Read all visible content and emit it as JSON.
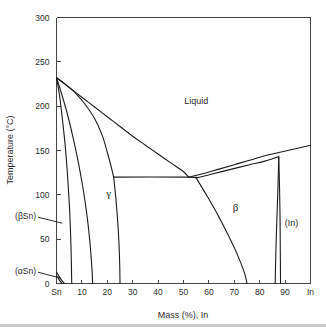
{
  "chart_data": {
    "type": "line",
    "title": "",
    "xlabel": "Mass (%), In",
    "ylabel": "Temperature (°C)",
    "xlim": [
      0,
      100
    ],
    "ylim": [
      0,
      300
    ],
    "grid": false,
    "legend": null,
    "x_ticks": [
      {
        "value": 0,
        "label": "Sn"
      },
      {
        "value": 10,
        "label": "10"
      },
      {
        "value": 20,
        "label": "20"
      },
      {
        "value": 30,
        "label": "30"
      },
      {
        "value": 40,
        "label": "40"
      },
      {
        "value": 50,
        "label": "50"
      },
      {
        "value": 60,
        "label": "60"
      },
      {
        "value": 70,
        "label": "70"
      },
      {
        "value": 80,
        "label": "80"
      },
      {
        "value": 90,
        "label": "90"
      },
      {
        "value": 100,
        "label": "In"
      }
    ],
    "y_ticks": [
      {
        "value": 0,
        "label": "0"
      },
      {
        "value": 50,
        "label": "50"
      },
      {
        "value": 100,
        "label": "100"
      },
      {
        "value": 150,
        "label": "150"
      },
      {
        "value": 200,
        "label": "200"
      },
      {
        "value": 250,
        "label": "250"
      },
      {
        "value": 300,
        "label": "300"
      }
    ],
    "phase_labels": [
      {
        "name": "liquid",
        "text": "Liquid",
        "x": 55,
        "y": 202
      },
      {
        "name": "gamma",
        "text": "γ",
        "x": 20.5,
        "y": 98
      },
      {
        "name": "beta",
        "text": "β",
        "x": 70.5,
        "y": 82
      },
      {
        "name": "indium",
        "text": "(In)",
        "x": 92.5,
        "y": 65
      }
    ],
    "annotations": [
      {
        "name": "beta-tin",
        "text": "(βSn)",
        "tip_x": 2.3,
        "tip_y": 68
      },
      {
        "name": "alpha-tin",
        "text": "(αSn)",
        "tip_x": 1.6,
        "tip_y": 6
      }
    ],
    "series": [
      {
        "name": "sn-liquidus",
        "comment": "Liquidus falling from Sn melting point 232C to eutectic at ~52%, 120C",
        "points": [
          [
            0,
            232
          ],
          [
            5,
            221
          ],
          [
            10,
            210
          ],
          [
            15,
            199
          ],
          [
            20,
            188
          ],
          [
            25,
            177
          ],
          [
            30,
            166
          ],
          [
            35,
            156
          ],
          [
            40,
            146
          ],
          [
            45,
            136
          ],
          [
            50,
            126
          ],
          [
            52,
            120
          ]
        ]
      },
      {
        "name": "in-liquidus",
        "comment": "Liquidus rising from eutectic 52%,120C to In melting point 156C",
        "points": [
          [
            52,
            120
          ],
          [
            58,
            124
          ],
          [
            64,
            129
          ],
          [
            70,
            134
          ],
          [
            76,
            139
          ],
          [
            82,
            144
          ],
          [
            88,
            148
          ],
          [
            94,
            152
          ],
          [
            100,
            156
          ]
        ]
      },
      {
        "name": "gamma-solidus",
        "comment": "Upper gamma boundary from 232C to plateau at 22.5%,120C",
        "points": [
          [
            0,
            232
          ],
          [
            3,
            226
          ],
          [
            7,
            216
          ],
          [
            11,
            203
          ],
          [
            15,
            186
          ],
          [
            18,
            167
          ],
          [
            20,
            148
          ],
          [
            21.5,
            132
          ],
          [
            22.5,
            120
          ]
        ]
      },
      {
        "name": "gamma-solvus-right",
        "comment": "Gamma right solvus from plateau 22.5%,120C down to ~25% at 0C",
        "points": [
          [
            22.5,
            120
          ],
          [
            23.4,
            95
          ],
          [
            24.1,
            70
          ],
          [
            24.6,
            45
          ],
          [
            24.9,
            20
          ],
          [
            25.0,
            0
          ]
        ]
      },
      {
        "name": "sn-solidus",
        "comment": "(betaSn) solidus from 232C down to ~6% at 0C",
        "points": [
          [
            0,
            232
          ],
          [
            1.2,
            212
          ],
          [
            2.3,
            186
          ],
          [
            3.4,
            156
          ],
          [
            4.3,
            124
          ],
          [
            5.0,
            92
          ],
          [
            5.5,
            60
          ],
          [
            5.8,
            30
          ],
          [
            6.0,
            0
          ]
        ]
      },
      {
        "name": "sn-solvus",
        "comment": "(betaSn) solvus from 232C down to ~14% at 0C",
        "points": [
          [
            0,
            232
          ],
          [
            2.0,
            214
          ],
          [
            4.2,
            192
          ],
          [
            6.4,
            166
          ],
          [
            8.5,
            138
          ],
          [
            10.4,
            108
          ],
          [
            12.0,
            77
          ],
          [
            13.2,
            45
          ],
          [
            14.0,
            15
          ],
          [
            14.2,
            0
          ]
        ]
      },
      {
        "name": "eutectic-plateau",
        "comment": "Horizontal eutectic/peritectic line at 120C between gamma and beta",
        "points": [
          [
            22.5,
            120
          ],
          [
            52,
            120
          ],
          [
            55,
            119
          ]
        ]
      },
      {
        "name": "beta-solvus-left",
        "comment": "Beta left solvus from 55%,119C down to ~75% at 0C",
        "points": [
          [
            55,
            119
          ],
          [
            59,
            100
          ],
          [
            63,
            80
          ],
          [
            67,
            58
          ],
          [
            71,
            34
          ],
          [
            74,
            12
          ],
          [
            75,
            0
          ]
        ]
      },
      {
        "name": "beta-solidus-right",
        "comment": "Beta right boundary rising toward In peritectic ~87.5%,143C",
        "points": [
          [
            55,
            119
          ],
          [
            62,
            124
          ],
          [
            69,
            129
          ],
          [
            76,
            134
          ],
          [
            82,
            138
          ],
          [
            87.5,
            143
          ]
        ]
      },
      {
        "name": "indium-solidus",
        "comment": "Narrow (In) terminal solid solution, left edge",
        "points": [
          [
            87.5,
            143
          ],
          [
            87.2,
            110
          ],
          [
            86.8,
            75
          ],
          [
            86.4,
            40
          ],
          [
            86.1,
            0
          ]
        ]
      },
      {
        "name": "indium-solvus",
        "comment": "Narrow (In) terminal solid solution, right edge",
        "points": [
          [
            87.5,
            143
          ],
          [
            87.8,
            110
          ],
          [
            88.0,
            75
          ],
          [
            88.1,
            40
          ],
          [
            88.2,
            0
          ]
        ]
      },
      {
        "name": "alpha-sn-upper",
        "comment": "Small (alphaSn) region near origin, upper boundary",
        "points": [
          [
            0,
            13
          ],
          [
            1.0,
            8
          ],
          [
            2.2,
            3
          ],
          [
            3.2,
            0
          ]
        ]
      },
      {
        "name": "alpha-sn-lower",
        "comment": "Small (alphaSn) region near origin, lower boundary",
        "points": [
          [
            0,
            9
          ],
          [
            0.9,
            5
          ],
          [
            1.9,
            1
          ],
          [
            2.4,
            0
          ]
        ]
      }
    ]
  },
  "style": {
    "line_color": "#1a1a1a",
    "axis_color": "#444444",
    "text_color": "#2b2b2b",
    "background": "#ffffff",
    "rule_color": "#c9c9c9"
  }
}
